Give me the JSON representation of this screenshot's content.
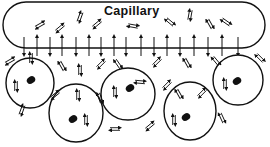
{
  "diagram": {
    "title": "Capillary",
    "colors": {
      "ink": "#111111",
      "background": "#ffffff"
    },
    "capillary": {
      "x": 3,
      "y": 2,
      "width": 262,
      "height": 46,
      "radius": 23
    },
    "wall_arrows": {
      "y_line": 48,
      "x": [
        24,
        37,
        50,
        62,
        76,
        89,
        101,
        114,
        126,
        141,
        154,
        167,
        180,
        194,
        208,
        222,
        238
      ],
      "directions": [
        "down",
        "up",
        "down",
        "up",
        "down",
        "up",
        "down",
        "up",
        "down",
        "up",
        "down",
        "up",
        "down",
        "up",
        "down",
        "up",
        "down"
      ]
    },
    "cells": [
      {
        "cx": 30,
        "cy": 83,
        "rx": 24,
        "ry": 25,
        "nucleus": {
          "cx": 31,
          "cy": 80
        }
      },
      {
        "cx": 76,
        "cy": 113,
        "rx": 27,
        "ry": 29,
        "nucleus": {
          "cx": 73,
          "cy": 119
        }
      },
      {
        "cx": 128,
        "cy": 94,
        "rx": 27,
        "ry": 26,
        "nucleus": {
          "cx": 130,
          "cy": 88
        }
      },
      {
        "cx": 190,
        "cy": 111,
        "rx": 26,
        "ry": 29,
        "nucleus": {
          "cx": 186,
          "cy": 117
        }
      },
      {
        "cx": 238,
        "cy": 80,
        "rx": 25,
        "ry": 25,
        "nucleus": {
          "cx": 237,
          "cy": 81
        }
      }
    ],
    "exchange_arrow_pairs": [
      {
        "x": 40,
        "y": 25,
        "angle": -30
      },
      {
        "x": 60,
        "y": 28,
        "angle": -40
      },
      {
        "x": 80,
        "y": 17,
        "angle": -70
      },
      {
        "x": 97,
        "y": 24,
        "angle": -40
      },
      {
        "x": 133,
        "y": 26,
        "angle": 10
      },
      {
        "x": 170,
        "y": 22,
        "angle": 40
      },
      {
        "x": 190,
        "y": 15,
        "angle": -80
      },
      {
        "x": 210,
        "y": 24,
        "angle": 60
      },
      {
        "x": 226,
        "y": 22,
        "angle": 35
      },
      {
        "x": 10,
        "y": 61,
        "angle": -30
      },
      {
        "x": 31,
        "y": 58,
        "angle": -90
      },
      {
        "x": 62,
        "y": 66,
        "angle": 60
      },
      {
        "x": 80,
        "y": 70,
        "angle": -90
      },
      {
        "x": 101,
        "y": 64,
        "angle": -45
      },
      {
        "x": 118,
        "y": 64,
        "angle": 55
      },
      {
        "x": 157,
        "y": 62,
        "angle": -45
      },
      {
        "x": 187,
        "y": 63,
        "angle": 60
      },
      {
        "x": 216,
        "y": 61,
        "angle": 50
      },
      {
        "x": 260,
        "y": 58,
        "angle": 45
      },
      {
        "x": 16,
        "y": 86,
        "angle": -90
      },
      {
        "x": 115,
        "y": 92,
        "angle": -90
      },
      {
        "x": 140,
        "y": 82,
        "angle": 5
      },
      {
        "x": 167,
        "y": 85,
        "angle": -45
      },
      {
        "x": 225,
        "y": 84,
        "angle": -90
      },
      {
        "x": 55,
        "y": 95,
        "angle": -40
      },
      {
        "x": 100,
        "y": 98,
        "angle": 70
      },
      {
        "x": 179,
        "y": 94,
        "angle": 60
      },
      {
        "x": 202,
        "y": 93,
        "angle": -45
      },
      {
        "x": 22,
        "y": 110,
        "angle": -70
      },
      {
        "x": 78,
        "y": 95,
        "angle": -90
      },
      {
        "x": 86,
        "y": 120,
        "angle": -90
      },
      {
        "x": 174,
        "y": 120,
        "angle": -90
      },
      {
        "x": 222,
        "y": 118,
        "angle": 65
      },
      {
        "x": 150,
        "y": 126,
        "angle": -40
      },
      {
        "x": 115,
        "y": 129,
        "angle": 0
      }
    ]
  }
}
